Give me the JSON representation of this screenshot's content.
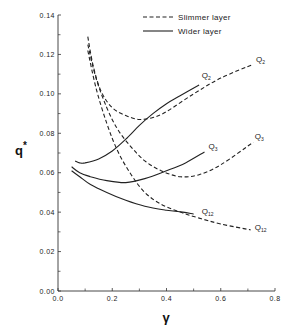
{
  "chart_data": {
    "type": "line",
    "title": "",
    "xlabel": "γ",
    "ylabel": "q*",
    "xlim": [
      0.0,
      0.8
    ],
    "ylim": [
      0.0,
      0.14
    ],
    "x_ticks": [
      "0.0",
      "0.2",
      "0.4",
      "0.6",
      "0.8"
    ],
    "x_tick_values": [
      0.0,
      0.2,
      0.4,
      0.6,
      0.8
    ],
    "x_minor_ticks": [
      0.1,
      0.3,
      0.5,
      0.7
    ],
    "y_ticks": [
      "0.00",
      "0.02",
      "0.04",
      "0.06",
      "0.08",
      "0.10",
      "0.12",
      "0.14"
    ],
    "y_tick_values": [
      0.0,
      0.02,
      0.04,
      0.06,
      0.08,
      0.1,
      0.12,
      0.14
    ],
    "y_minor_ticks": [
      0.01,
      0.03,
      0.05,
      0.07,
      0.09,
      0.11,
      0.13
    ],
    "grid": false,
    "legend": {
      "position": "top-right",
      "entries": [
        {
          "label": "Slimmer layer",
          "style": "dashed"
        },
        {
          "label": "Wider layer",
          "style": "solid"
        }
      ]
    },
    "series": [
      {
        "name": "Q2",
        "layer": "Slimmer layer",
        "style": "dashed",
        "x": [
          0.11,
          0.13,
          0.16,
          0.2,
          0.25,
          0.3,
          0.35,
          0.4,
          0.5,
          0.6,
          0.72
        ],
        "y": [
          0.129,
          0.114,
          0.101,
          0.093,
          0.089,
          0.087,
          0.088,
          0.091,
          0.1,
          0.108,
          0.115
        ]
      },
      {
        "name": "Q3",
        "layer": "Slimmer layer",
        "style": "dashed",
        "x": [
          0.11,
          0.14,
          0.18,
          0.22,
          0.27,
          0.32,
          0.38,
          0.45,
          0.52,
          0.6,
          0.72
        ],
        "y": [
          0.125,
          0.108,
          0.093,
          0.082,
          0.073,
          0.066,
          0.061,
          0.058,
          0.059,
          0.064,
          0.0755
        ]
      },
      {
        "name": "Q12",
        "layer": "Slimmer layer",
        "style": "dashed",
        "x": [
          0.11,
          0.14,
          0.18,
          0.22,
          0.27,
          0.32,
          0.38,
          0.45,
          0.52,
          0.6,
          0.71
        ],
        "y": [
          0.122,
          0.103,
          0.085,
          0.071,
          0.059,
          0.05,
          0.044,
          0.04,
          0.037,
          0.034,
          0.031
        ]
      },
      {
        "name": "Q2",
        "layer": "Wider layer",
        "style": "solid",
        "x": [
          0.063,
          0.08,
          0.1,
          0.15,
          0.2,
          0.25,
          0.3,
          0.35,
          0.4,
          0.45,
          0.52
        ],
        "y": [
          0.066,
          0.065,
          0.065,
          0.067,
          0.071,
          0.077,
          0.084,
          0.09,
          0.095,
          0.099,
          0.1045
        ]
      },
      {
        "name": "Q3",
        "layer": "Wider layer",
        "style": "solid",
        "x": [
          0.05,
          0.08,
          0.12,
          0.18,
          0.25,
          0.32,
          0.4,
          0.47,
          0.54
        ],
        "y": [
          0.063,
          0.06,
          0.058,
          0.056,
          0.055,
          0.057,
          0.061,
          0.065,
          0.0705
        ]
      },
      {
        "name": "Q12",
        "layer": "Wider layer",
        "style": "solid",
        "x": [
          0.05,
          0.08,
          0.12,
          0.18,
          0.25,
          0.32,
          0.4,
          0.46,
          0.5
        ],
        "y": [
          0.061,
          0.058,
          0.054,
          0.05,
          0.046,
          0.043,
          0.041,
          0.04,
          0.039
        ]
      }
    ],
    "annotations": [
      {
        "text": "Q2",
        "x": 0.53,
        "y": 0.108,
        "series": "Wider Q2"
      },
      {
        "text": "Q2",
        "x": 0.73,
        "y": 0.116,
        "series": "Slimmer Q2"
      },
      {
        "text": "Q3",
        "x": 0.555,
        "y": 0.072,
        "series": "Wider Q3"
      },
      {
        "text": "Q3",
        "x": 0.725,
        "y": 0.077,
        "series": "Slimmer Q3"
      },
      {
        "text": "Q12",
        "x": 0.53,
        "y": 0.039,
        "series": "Wider Q12"
      },
      {
        "text": "Q12",
        "x": 0.725,
        "y": 0.031,
        "series": "Slimmer Q12"
      }
    ]
  },
  "labels": {
    "x_axis": "γ",
    "y_axis_main": "q",
    "y_axis_sup": "*"
  }
}
